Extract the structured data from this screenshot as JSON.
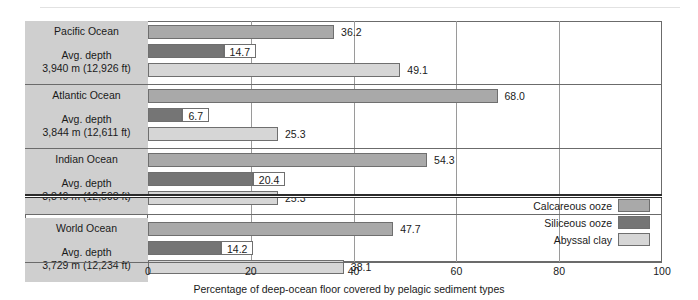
{
  "chart_data": {
    "type": "bar",
    "orientation": "horizontal",
    "title": "",
    "xlabel": "Percentage of deep-ocean floor covered by pelagic sediment types",
    "ylabel": "",
    "xlim": [
      0,
      100
    ],
    "xticks": [
      0,
      20,
      40,
      60,
      80,
      100
    ],
    "xticklabels": [
      "0",
      "20",
      "40",
      "60",
      "80",
      "100"
    ],
    "grid": true,
    "legend_position": "inside-bottom-right",
    "series": [
      {
        "name": "Calcareous ooze",
        "color": "#a9a9a9",
        "values": [
          36.2,
          68.0,
          54.3,
          47.7
        ]
      },
      {
        "name": "Siliceous ooze",
        "color": "#757575",
        "values": [
          14.7,
          6.7,
          20.4,
          14.2
        ]
      },
      {
        "name": "Abyssal clay",
        "color": "#d6d6d6",
        "values": [
          49.1,
          25.3,
          25.3,
          38.1
        ]
      }
    ],
    "categories": [
      "Pacific Ocean",
      "Atlantic Ocean",
      "Indian Ocean",
      "World Ocean"
    ],
    "groups": [
      {
        "name": "Pacific Ocean",
        "depth_line1": "Avg. depth",
        "depth_line2": "3,940 m (12,926 ft)",
        "bars": [
          {
            "series": "Calcareous ooze",
            "value": 36.2,
            "label": "36.2",
            "boxed": false
          },
          {
            "series": "Siliceous ooze",
            "value": 14.7,
            "label": "14.7",
            "boxed": true
          },
          {
            "series": "Abyssal clay",
            "value": 49.1,
            "label": "49.1",
            "boxed": false
          }
        ]
      },
      {
        "name": "Atlantic Ocean",
        "depth_line1": "Avg. depth",
        "depth_line2": "3,844 m (12,611 ft)",
        "bars": [
          {
            "series": "Calcareous ooze",
            "value": 68.0,
            "label": "68.0",
            "boxed": false
          },
          {
            "series": "Siliceous ooze",
            "value": 6.7,
            "label": "6.7",
            "boxed": true
          },
          {
            "series": "Abyssal clay",
            "value": 25.3,
            "label": "25.3",
            "boxed": false
          }
        ]
      },
      {
        "name": "Indian Ocean",
        "depth_line1": "Avg. depth",
        "depth_line2": "3,840 m (12,598 ft)",
        "bars": [
          {
            "series": "Calcareous ooze",
            "value": 54.3,
            "label": "54.3",
            "boxed": false
          },
          {
            "series": "Siliceous ooze",
            "value": 20.4,
            "label": "20.4",
            "boxed": true
          },
          {
            "series": "Abyssal clay",
            "value": 25.3,
            "label": "25.3",
            "boxed": false
          }
        ]
      },
      {
        "name": "World Ocean",
        "depth_line1": "Avg. depth",
        "depth_line2": "3,729 m (12,234 ft)",
        "bars": [
          {
            "series": "Calcareous ooze",
            "value": 47.7,
            "label": "47.7",
            "boxed": false
          },
          {
            "series": "Siliceous ooze",
            "value": 14.2,
            "label": "14.2",
            "boxed": true
          },
          {
            "series": "Abyssal clay",
            "value": 38.1,
            "label": "38.1",
            "boxed": false
          }
        ]
      }
    ],
    "legend": [
      {
        "label": "Calcareous ooze",
        "color": "#a9a9a9"
      },
      {
        "label": "Siliceous ooze",
        "color": "#757575"
      },
      {
        "label": "Abyssal clay",
        "color": "#d6d6d6"
      }
    ]
  },
  "axis": {
    "caption": "Percentage of deep-ocean floor covered by pelagic sediment types",
    "ticks": [
      "0",
      "20",
      "40",
      "60",
      "80",
      "100"
    ]
  },
  "colors": {
    "calcareous_ooze": "#a9a9a9",
    "siliceous_ooze": "#757575",
    "abyssal_clay": "#d6d6d6",
    "label_panel": "#cfcfcf",
    "frame": "#6b6b6b"
  }
}
